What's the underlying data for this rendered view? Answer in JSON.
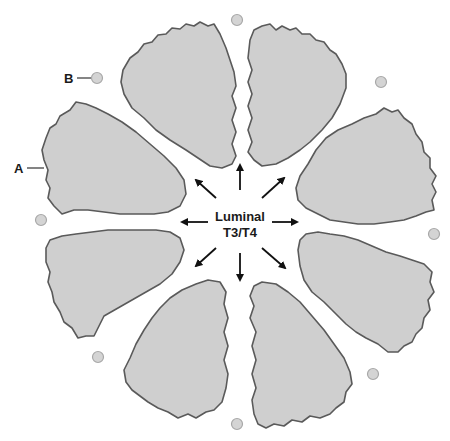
{
  "diagram": {
    "center_label": {
      "line1": "Luminal",
      "line2": "T3/T4"
    },
    "labels": {
      "a": "A",
      "b": "B"
    },
    "colors": {
      "cell_fill": "#cfcfcf",
      "cell_stroke": "#5a5a5a",
      "colloid_fill": "#d4d4d4",
      "arrow": "#111111",
      "background": "#ffffff"
    },
    "cell_count": 8,
    "arrow_count": 8,
    "small_circle_count": 8,
    "arrow_directions": [
      "up",
      "up-right",
      "right",
      "down-right",
      "down",
      "down-left",
      "left",
      "up-left"
    ]
  }
}
